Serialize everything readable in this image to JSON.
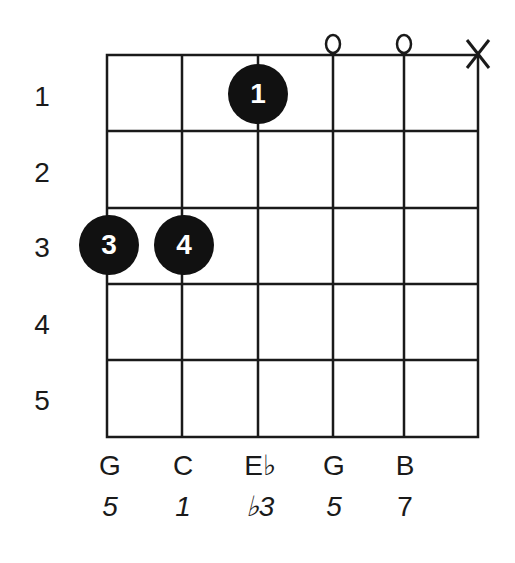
{
  "chord": {
    "strings_count": 6,
    "frets_count": 5,
    "fret_numbers": [
      "1",
      "2",
      "3",
      "4",
      "5"
    ],
    "string_markers": [
      {
        "string": 4,
        "symbol": "o",
        "meaning": "open"
      },
      {
        "string": 5,
        "symbol": "o",
        "meaning": "open"
      },
      {
        "string": 6,
        "symbol": "X",
        "meaning": "muted"
      }
    ],
    "fingers": [
      {
        "string": 3,
        "fret": 1,
        "label": "1"
      },
      {
        "string": 1,
        "fret": 3,
        "label": "3"
      },
      {
        "string": 2,
        "fret": 3,
        "label": "4"
      }
    ],
    "notes": [
      "G",
      "C",
      "E♭",
      "G",
      "B"
    ],
    "intervals": [
      "5",
      "1",
      "♭3",
      "5",
      "7"
    ]
  },
  "colors": {
    "line": "#1a1a1a",
    "dot": "#111111",
    "dot_text": "#ffffff",
    "background": "#ffffff"
  }
}
